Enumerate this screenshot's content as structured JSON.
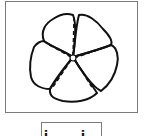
{
  "figure": {
    "petal_count": 5,
    "stroke_color": "#111111",
    "frame_color": "#7a7a7a"
  },
  "option_box": {
    "label": "i i"
  }
}
